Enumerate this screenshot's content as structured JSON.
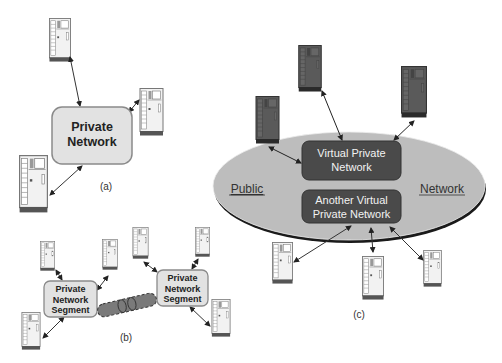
{
  "panels": {
    "a": {
      "caption": "(a)",
      "network": {
        "line1": "Private",
        "line2": "Network"
      },
      "servers": [
        {
          "x": 49,
          "y": 17,
          "w": 22,
          "h": 45
        },
        {
          "x": 139,
          "y": 88,
          "w": 25,
          "h": 46
        },
        {
          "x": 17,
          "y": 155,
          "w": 33,
          "h": 56
        }
      ]
    },
    "b": {
      "caption": "(b)",
      "segment_left": {
        "line1": "Private",
        "line2": "Network",
        "line3": "Segment"
      },
      "segment_right": {
        "line1": "Private",
        "line2": "Network",
        "line3": "Segment"
      },
      "tunnel_label": "tunnel"
    },
    "c": {
      "caption": "(c)",
      "public_label": "Public",
      "network_label": "Network",
      "vpn": {
        "line1": "Virtual Private",
        "line2": "Network"
      },
      "another_vpn": {
        "line1": "Another Virtual",
        "line2": "Private Network"
      }
    }
  },
  "colors": {
    "box_fill": "#e2e2e2",
    "box_stroke": "#8a8a8a",
    "ellipse_fill": "#bdbdbd",
    "ellipse_shadow": "#1a1a1a",
    "vpn_fill": "#4a4a4a",
    "dark_server": "#555555",
    "tunnel_fill": "#7a7a7a"
  }
}
